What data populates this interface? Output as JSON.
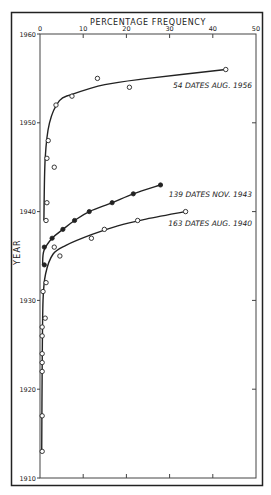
{
  "chart_data": {
    "type": "scatter",
    "title": "",
    "xlabel": "PERCENTAGE FREQUENCY",
    "ylabel": "YEAR",
    "xlim": [
      0,
      50
    ],
    "ylim": [
      1910,
      1960
    ],
    "x_ticks": [
      "0",
      "10",
      "20",
      "30",
      "40",
      "50"
    ],
    "y_ticks": [
      "1910",
      "1920",
      "1930",
      "1940",
      "1950",
      "1960"
    ],
    "x_axis_position": "top",
    "grid": false,
    "series": [
      {
        "name": "54 DATES AUG. 1956",
        "marker": "open-circle",
        "points": [
          {
            "x": 43,
            "y": 1956
          },
          {
            "x": 13.3,
            "y": 1955
          },
          {
            "x": 20.7,
            "y": 1954
          },
          {
            "x": 7.4,
            "y": 1953
          },
          {
            "x": 3.7,
            "y": 1952
          },
          {
            "x": 1.9,
            "y": 1948
          },
          {
            "x": 1.6,
            "y": 1946
          },
          {
            "x": 3.3,
            "y": 1945
          },
          {
            "x": 1.6,
            "y": 1941
          },
          {
            "x": 1.4,
            "y": 1939
          }
        ]
      },
      {
        "name": "139 DATES NOV. 1943",
        "marker": "filled-circle",
        "points": [
          {
            "x": 27.9,
            "y": 1943
          },
          {
            "x": 21.6,
            "y": 1942
          },
          {
            "x": 16.7,
            "y": 1941
          },
          {
            "x": 11.4,
            "y": 1940
          },
          {
            "x": 8,
            "y": 1939
          },
          {
            "x": 5.3,
            "y": 1938
          },
          {
            "x": 2.8,
            "y": 1937
          },
          {
            "x": 1,
            "y": 1936
          },
          {
            "x": 1,
            "y": 1934
          }
        ]
      },
      {
        "name": "163 DATES AUG. 1940",
        "marker": "open-circle",
        "points": [
          {
            "x": 33.7,
            "y": 1940
          },
          {
            "x": 22.6,
            "y": 1939
          },
          {
            "x": 14.9,
            "y": 1938
          },
          {
            "x": 11.9,
            "y": 1937
          },
          {
            "x": 3.3,
            "y": 1936
          },
          {
            "x": 4.6,
            "y": 1935
          },
          {
            "x": 1.4,
            "y": 1932
          },
          {
            "x": 0.7,
            "y": 1931
          },
          {
            "x": 1.2,
            "y": 1928
          },
          {
            "x": 0.5,
            "y": 1927
          },
          {
            "x": 0.5,
            "y": 1926
          },
          {
            "x": 0.5,
            "y": 1924
          },
          {
            "x": 0.5,
            "y": 1923
          },
          {
            "x": 0.5,
            "y": 1922
          },
          {
            "x": 0.5,
            "y": 1917
          },
          {
            "x": 0.5,
            "y": 1913
          }
        ]
      }
    ],
    "annotations": [
      {
        "text": "54 DATES AUG. 1956",
        "x": 32,
        "y": 1954
      },
      {
        "text": "139 DATES NOV. 1943",
        "x": 30,
        "y": 1942
      },
      {
        "text": "163 DATES AUG. 1940",
        "x": 29,
        "y": 1939
      }
    ]
  }
}
